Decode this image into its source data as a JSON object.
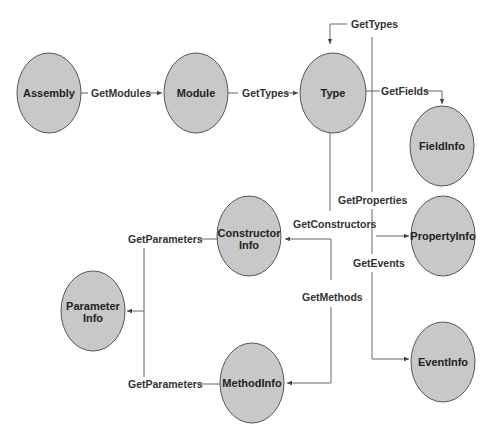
{
  "diagram": {
    "nodes": [
      {
        "id": "assembly",
        "label": "Assembly",
        "cx": 49,
        "cy": 93
      },
      {
        "id": "module",
        "label": "Module",
        "cx": 196,
        "cy": 93
      },
      {
        "id": "type",
        "label": "Type",
        "cx": 333,
        "cy": 93
      },
      {
        "id": "fieldinfo",
        "label": "FieldInfo",
        "cx": 442,
        "cy": 146
      },
      {
        "id": "propertyinfo",
        "label": "PropertyInfo",
        "cx": 443,
        "cy": 236
      },
      {
        "id": "eventinfo",
        "label": "EventInfo",
        "cx": 443,
        "cy": 362
      },
      {
        "id": "constructorinfo",
        "label_line1": "Constructor",
        "label_line2": "Info",
        "cx": 249,
        "cy": 236
      },
      {
        "id": "parameterinfo",
        "label_line1": "Parameter",
        "label_line2": "Info",
        "cx": 93,
        "cy": 311
      },
      {
        "id": "methodinfo",
        "label": "MethodInfo",
        "cx": 252,
        "cy": 383
      }
    ],
    "edges": [
      {
        "label": "GetModules",
        "from": "assembly",
        "to": "module"
      },
      {
        "label": "GetTypes",
        "from": "module",
        "to": "type"
      },
      {
        "label": "GetTypes",
        "from": "type",
        "to": "type"
      },
      {
        "label": "GetFields",
        "from": "type",
        "to": "fieldinfo"
      },
      {
        "label": "GetProperties",
        "from": "type",
        "to": "propertyinfo"
      },
      {
        "label": "GetEvents",
        "from": "type",
        "to": "eventinfo"
      },
      {
        "label": "GetConstructors",
        "from": "type",
        "to": "constructorinfo"
      },
      {
        "label": "GetMethods",
        "from": "type",
        "to": "methodinfo"
      },
      {
        "label": "GetParameters",
        "from": "constructorinfo",
        "to": "parameterinfo"
      },
      {
        "label": "GetParameters",
        "from": "methodinfo",
        "to": "parameterinfo"
      }
    ]
  }
}
